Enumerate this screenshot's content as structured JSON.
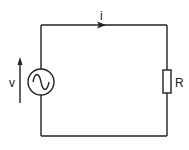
{
  "diagram": {
    "type": "circuit",
    "components": [
      {
        "id": "source",
        "kind": "ac-voltage-source",
        "symbol": "~"
      },
      {
        "id": "resistor",
        "kind": "resistor",
        "label": "R"
      }
    ],
    "labels": {
      "current": "i",
      "voltage": "v",
      "resistor": "R"
    },
    "colors": {
      "line": "#222222",
      "background": "#ffffff"
    }
  }
}
